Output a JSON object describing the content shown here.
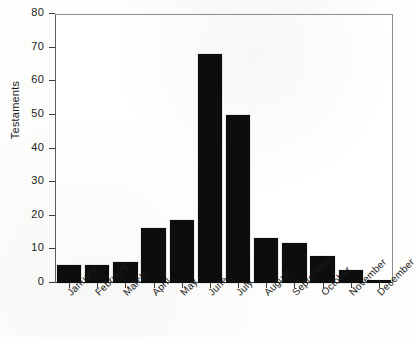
{
  "chart_data": {
    "type": "bar",
    "title": "",
    "xlabel": "",
    "ylabel": "Testaments",
    "ylim": [
      0,
      80
    ],
    "yticks": [
      0,
      10,
      20,
      30,
      40,
      50,
      60,
      70,
      80
    ],
    "grid": false,
    "legend": null,
    "bar_color": "#0d0d0d",
    "categories": [
      "January",
      "February",
      "March",
      "April",
      "May",
      "June",
      "July",
      "August",
      "September",
      "October",
      "November",
      "December"
    ],
    "values": [
      5.5,
      5.5,
      6.3,
      16.3,
      18.7,
      68,
      50,
      13.5,
      12,
      8,
      4,
      1
    ]
  }
}
